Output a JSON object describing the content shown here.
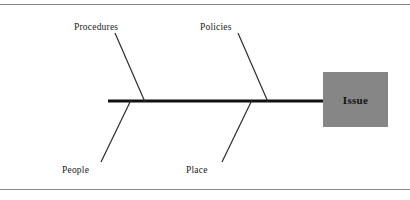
{
  "diagram": {
    "type": "fishbone-ishikawa",
    "effect": {
      "label": "Issue",
      "box_fill": "#868686",
      "text_color": "#111111"
    },
    "spine": {
      "color": "#111111",
      "x_start": 108,
      "x_end": 330,
      "y": 101,
      "thickness": 3
    },
    "categories": [
      {
        "label": "Procedures",
        "side": "top",
        "join_x": 145,
        "tip_x": 115,
        "tip_y": 33
      },
      {
        "label": "Policies",
        "side": "top",
        "join_x": 268,
        "tip_x": 238,
        "tip_y": 33
      },
      {
        "label": "People",
        "side": "bottom",
        "join_x": 131,
        "tip_x": 101,
        "tip_y": 162
      },
      {
        "label": "Place",
        "side": "bottom",
        "join_x": 252,
        "tip_x": 222,
        "tip_y": 162
      }
    ],
    "rules": {
      "top_y": 4,
      "bottom_y": 189,
      "color": "#8a8a8a"
    },
    "bone_color": "#2b2b2b",
    "background": "#ffffff"
  }
}
